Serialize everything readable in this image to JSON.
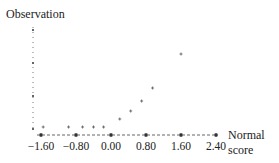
{
  "chart_data": {
    "type": "scatter",
    "title": "",
    "ylabel": "Observation",
    "xlabel": "Normal score",
    "xlabel_lines": [
      "Normal",
      "score"
    ],
    "x_ticks": [
      "-1.60",
      "-0.80",
      "0.00",
      "0.80",
      "1.60",
      "2.40"
    ],
    "x_tick_values": [
      -1.6,
      -0.8,
      0.0,
      0.8,
      1.6,
      2.4
    ],
    "xlim": [
      -1.7,
      2.45
    ],
    "grid": false,
    "legend": false,
    "points": [
      {
        "x": -1.55,
        "y": 0.0
      },
      {
        "x": -0.97,
        "y": 0.0
      },
      {
        "x": -0.65,
        "y": 0.0
      },
      {
        "x": -0.4,
        "y": 0.0
      },
      {
        "x": -0.17,
        "y": 0.0
      },
      {
        "x": 0.2,
        "y": 0.08
      },
      {
        "x": 0.45,
        "y": 0.16
      },
      {
        "x": 0.7,
        "y": 0.26
      },
      {
        "x": 0.95,
        "y": 0.39
      },
      {
        "x": 1.6,
        "y": 0.73
      }
    ],
    "series": [
      {
        "name": "Observation vs Normal score",
        "values": [
          0.0,
          0.0,
          0.0,
          0.0,
          0.0,
          0.08,
          0.16,
          0.26,
          0.39,
          0.73
        ]
      }
    ]
  }
}
